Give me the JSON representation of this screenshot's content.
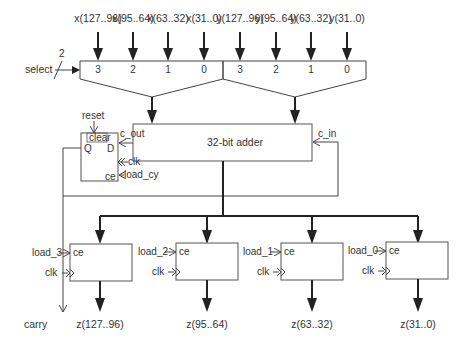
{
  "diagram": {
    "title": "",
    "inputs_x": [
      "x(127..96)",
      "x(95..64)",
      "x(63..32)",
      "x(31..0)"
    ],
    "inputs_y": [
      "y(127..96)",
      "y(95..64)",
      "y(63..32)",
      "y(31..0)"
    ],
    "mux_ports_x": [
      "3",
      "2",
      "1",
      "0"
    ],
    "mux_ports_y": [
      "3",
      "2",
      "1",
      "0"
    ],
    "select": {
      "label": "select",
      "width": "2"
    },
    "adder": {
      "label": "32-bit adder",
      "carry_out": "c_out",
      "carry_in": "c_in"
    },
    "carry_ff": {
      "reset": "reset",
      "clear": "clear",
      "q": "Q",
      "d": "D",
      "clk": "clk",
      "ce": "ce",
      "load": "load_cy",
      "output": "carry"
    },
    "registers": [
      {
        "load": "load_3",
        "ce": "ce",
        "clk": "clk",
        "output": "z(127..96)"
      },
      {
        "load": "load_2",
        "ce": "ce",
        "clk": "clk",
        "output": "z(95..64)"
      },
      {
        "load": "load_1",
        "ce": "ce",
        "clk": "clk",
        "output": "z(63..32)"
      },
      {
        "load": "load_0",
        "ce": "ce",
        "clk": "clk",
        "output": "z(31..0)"
      }
    ]
  }
}
